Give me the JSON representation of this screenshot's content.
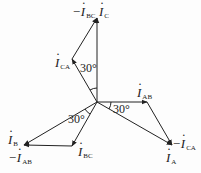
{
  "diagram": {
    "type": "phasor",
    "origin": [
      97,
      102
    ],
    "colors": {
      "line": "#222222",
      "background": "#fdfdfd"
    },
    "phasors": [
      {
        "name": "I_AB",
        "label": "I",
        "sub": "AB",
        "from": [
          97,
          102
        ],
        "to": [
          147,
          102
        ]
      },
      {
        "name": "-I_CA",
        "label": "−I",
        "sub": "CA",
        "from": [
          147,
          102
        ],
        "to": [
          172,
          145
        ]
      },
      {
        "name": "I_A",
        "label": "I",
        "sub": "A",
        "from": [
          97,
          102
        ],
        "to": [
          172,
          145
        ]
      },
      {
        "name": "I_BC",
        "label": "I",
        "sub": "BC",
        "from": [
          97,
          102
        ],
        "to": [
          72,
          146
        ]
      },
      {
        "name": "-I_AB",
        "label": "−I",
        "sub": "AB",
        "from": [
          72,
          146
        ],
        "to": [
          24,
          145
        ]
      },
      {
        "name": "I_B",
        "label": "I",
        "sub": "B",
        "from": [
          97,
          102
        ],
        "to": [
          24,
          145
        ]
      },
      {
        "name": "I_CA",
        "label": "I",
        "sub": "CA",
        "from": [
          97,
          102
        ],
        "to": [
          72,
          59
        ]
      },
      {
        "name": "-I_BC",
        "label": "−I",
        "sub": "BC",
        "from": [
          72,
          59
        ],
        "to": [
          97,
          18
        ]
      },
      {
        "name": "I_C",
        "label": "I",
        "sub": "C",
        "from": [
          97,
          102
        ],
        "to": [
          97,
          18
        ]
      }
    ],
    "labels": {
      "neg_ibc": {
        "prefix": "−",
        "main": "I",
        "sub": "BC"
      },
      "ic": {
        "main": "I",
        "sub": "C"
      },
      "ica": {
        "main": "I",
        "sub": "CA"
      },
      "iab": {
        "main": "I",
        "sub": "AB"
      },
      "neg_ica": {
        "prefix": "−",
        "main": "I",
        "sub": "CA"
      },
      "ia": {
        "main": "I",
        "sub": "A"
      },
      "ib": {
        "main": "I",
        "sub": "B"
      },
      "neg_iab": {
        "prefix": "−",
        "main": "I",
        "sub": "AB"
      },
      "ibc": {
        "main": "I",
        "sub": "BC"
      }
    },
    "angles": [
      {
        "text": "30°",
        "between": [
          "I_CA",
          "I_C"
        ]
      },
      {
        "text": "30°",
        "between": [
          "I_AB",
          "I_A"
        ]
      },
      {
        "text": "30°",
        "between": [
          "I_B",
          "I_BC"
        ]
      }
    ]
  }
}
